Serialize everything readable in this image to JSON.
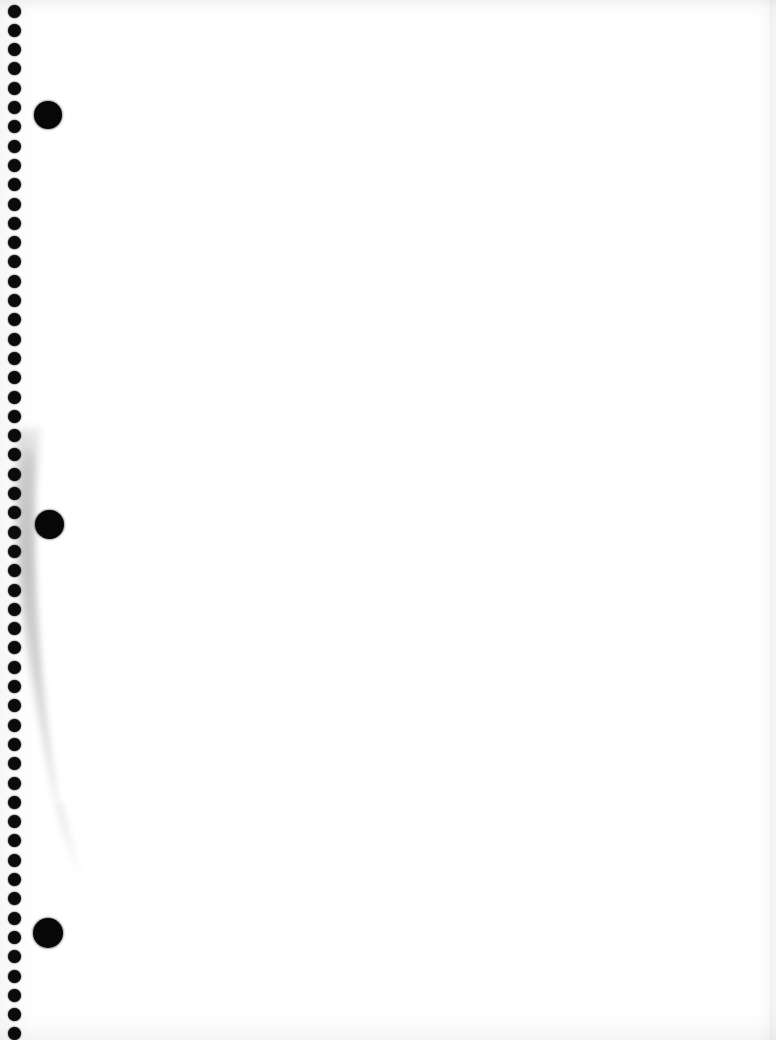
{
  "page": {
    "kind": "scanned-blank-page",
    "width": 776,
    "height": 1040,
    "background_color": "#ffffff",
    "ink_color": "#0b0b0b",
    "smudge_color": "#b9b9b9"
  },
  "hole_column": {
    "label": "punch-hole dot column",
    "count": 54,
    "center_x": 14.5,
    "first_center_y": 11,
    "spacing": 19.3,
    "diameter": 13,
    "color": "#0b0b0b"
  },
  "big_dots": [
    {
      "label": "large dot top",
      "cx": 48,
      "cy": 115,
      "d": 28,
      "color": "#070707"
    },
    {
      "label": "large dot middle",
      "cx": 49,
      "cy": 524,
      "d": 29,
      "color": "#070707"
    },
    {
      "label": "large dot bottom",
      "cx": 48,
      "cy": 933,
      "d": 30,
      "color": "#070707"
    }
  ],
  "smudge": {
    "label": "grey diagonal smudge streak",
    "start": {
      "x": 26,
      "y": 425
    },
    "end": {
      "x": 78,
      "y": 870
    },
    "max_width": 34,
    "color": "#b9b9b9",
    "opacity": 0.55
  },
  "edges": {
    "top_band_color": "#f3f3f3",
    "bottom_band_color": "#f4f4f4",
    "right_edge_color": "#f2f2f2"
  }
}
